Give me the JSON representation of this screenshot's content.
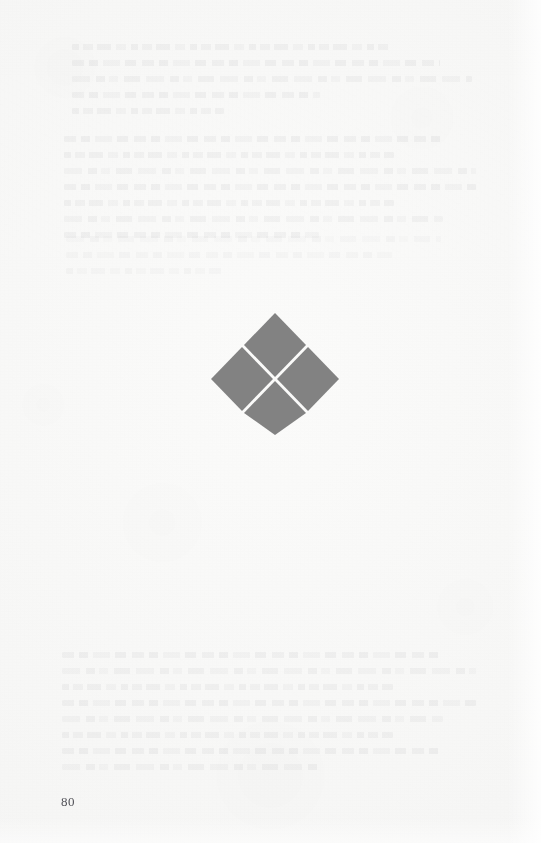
{
  "document": {
    "kind": "scanned-book-page",
    "page_number": "80",
    "paper_color": "#f8f8f7",
    "ink_color": "#43434a"
  },
  "ornament": {
    "name": "four-diamond-ornament",
    "description": "Decorative quatrefoil of four gray lozenges separated by a white cross",
    "fill_color": "#828282",
    "diamond_count": 4,
    "center_x": 65,
    "center_y": 63,
    "half_span": 63,
    "gap": 5
  },
  "showthrough": {
    "label": "reverse-side bleed-through",
    "legible": false,
    "blocks": [
      {
        "id": "ghost-top",
        "lines": 5
      },
      {
        "id": "ghost-mid",
        "lines": 7
      },
      {
        "id": "ghost-tail",
        "lines": 3
      },
      {
        "id": "ghost-bottom",
        "lines": 8
      }
    ]
  },
  "folio": {
    "text": "80"
  }
}
